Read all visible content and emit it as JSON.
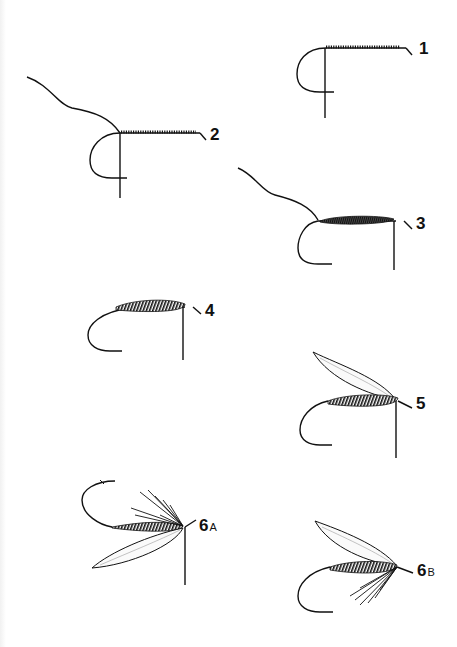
{
  "figure": {
    "background": "#ffffff",
    "ink": "#111111"
  },
  "steps": [
    {
      "id": "1",
      "label": "1",
      "sub": "",
      "description": "Thread wound along hook shank"
    },
    {
      "id": "2",
      "label": "2",
      "sub": "",
      "description": "Tinsel/rib tied in at bend, thread wound to eye"
    },
    {
      "id": "3",
      "label": "3",
      "sub": "",
      "description": "Body dubbed/floss wound on shank"
    },
    {
      "id": "4",
      "label": "4",
      "sub": "",
      "description": "Ribbing wound over body"
    },
    {
      "id": "5",
      "label": "5",
      "sub": "",
      "description": "Wing tied in on top at head"
    },
    {
      "id": "6A",
      "label": "6",
      "sub": "A",
      "description": "Hackle and wing, inverted view"
    },
    {
      "id": "6B",
      "label": "6",
      "sub": "B",
      "description": "Finished wet fly with hackle beneath"
    }
  ]
}
